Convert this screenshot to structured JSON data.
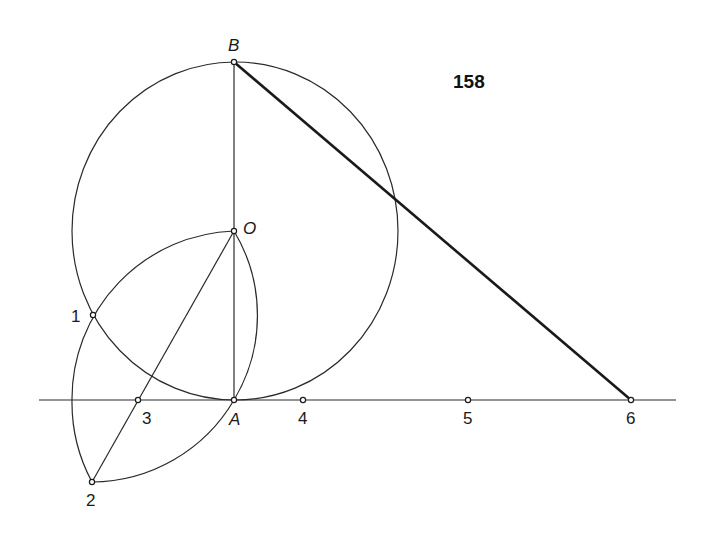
{
  "figure_number": "158",
  "points": {
    "B": {
      "label": "B",
      "x": 234,
      "y": 62
    },
    "O": {
      "label": "O",
      "x": 234,
      "y": 231
    },
    "A": {
      "label": "A",
      "x": 234,
      "y": 400
    },
    "p1": {
      "label": "1",
      "x": 93,
      "y": 315
    },
    "p2": {
      "label": "2",
      "x": 92,
      "y": 482
    },
    "p3": {
      "label": "3",
      "x": 138,
      "y": 400
    },
    "p4": {
      "label": "4",
      "x": 303,
      "y": 400
    },
    "p5": {
      "label": "5",
      "x": 468,
      "y": 400
    },
    "p6": {
      "label": "6",
      "x": 631,
      "y": 400
    }
  },
  "elements": {
    "big_circle": {
      "center": "O",
      "radius": 165
    },
    "base_line": {
      "from_x": 39,
      "to_x": 676,
      "y": 400
    },
    "arc_center_A": {
      "from": "O",
      "via": "1",
      "to": "2"
    },
    "arc_center_1_upper": {
      "from": "O",
      "to": "A"
    },
    "arc_center_1_lower": {
      "from": "A",
      "to": "2"
    },
    "segment_BA": {
      "from": "B",
      "to": "A"
    },
    "segment_2O": {
      "from": "2",
      "to": "O"
    },
    "segment_B6": {
      "from": "B",
      "to": "6",
      "style": "bold"
    }
  }
}
